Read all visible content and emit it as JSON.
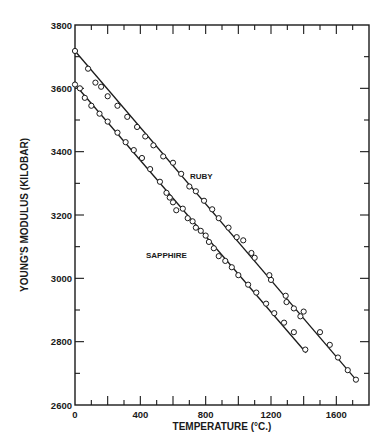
{
  "chart_data": {
    "type": "scatter",
    "title": "",
    "xlabel": "TEMPERATURE (°C.)",
    "ylabel": "YOUNG'S MODULUS (KILOBAR)",
    "xlim": [
      0,
      1800
    ],
    "ylim": [
      2600,
      3800
    ],
    "x_ticks": [
      0,
      400,
      800,
      1200,
      1600
    ],
    "x_tick_labels": [
      "0",
      "400",
      "800",
      "1200",
      "1600"
    ],
    "y_ticks": [
      2600,
      2800,
      3000,
      3200,
      3400,
      3600,
      3800
    ],
    "y_tick_labels": [
      "2600",
      "2800",
      "3000",
      "3200",
      "3400",
      "3600",
      "3800"
    ],
    "grid": false,
    "legend": "none (inline labels)",
    "annotations": [
      {
        "text": "RUBY",
        "x": 860,
        "y": 3290
      },
      {
        "text": "SAPPHIRE",
        "x": 560,
        "y": 3035
      }
    ],
    "series": [
      {
        "name": "RUBY",
        "marker": "open-circle",
        "fit_line": {
          "x0": 0,
          "y0": 3718,
          "x1": 1720,
          "y1": 2680
        },
        "points": [
          [
            0,
            3718
          ],
          [
            80,
            3662
          ],
          [
            125,
            3618
          ],
          [
            160,
            3605
          ],
          [
            200,
            3575
          ],
          [
            260,
            3545
          ],
          [
            320,
            3510
          ],
          [
            380,
            3478
          ],
          [
            430,
            3448
          ],
          [
            480,
            3420
          ],
          [
            540,
            3385
          ],
          [
            600,
            3365
          ],
          [
            650,
            3330
          ],
          [
            700,
            3290
          ],
          [
            740,
            3275
          ],
          [
            790,
            3245
          ],
          [
            840,
            3218
          ],
          [
            880,
            3190
          ],
          [
            940,
            3160
          ],
          [
            990,
            3130
          ],
          [
            1030,
            3120
          ],
          [
            1080,
            3080
          ],
          [
            1100,
            3065
          ],
          [
            1190,
            3010
          ],
          [
            1200,
            2995
          ],
          [
            1290,
            2945
          ],
          [
            1295,
            2925
          ],
          [
            1340,
            2905
          ],
          [
            1380,
            2880
          ],
          [
            1400,
            2895
          ],
          [
            1500,
            2830
          ],
          [
            1560,
            2790
          ],
          [
            1610,
            2750
          ],
          [
            1670,
            2710
          ],
          [
            1720,
            2680
          ]
        ]
      },
      {
        "name": "SAPPHIRE",
        "marker": "open-circle",
        "fit_line": {
          "x0": 0,
          "y0": 3612,
          "x1": 1415,
          "y1": 2765
        },
        "points": [
          [
            0,
            3612
          ],
          [
            30,
            3600
          ],
          [
            60,
            3570
          ],
          [
            100,
            3545
          ],
          [
            150,
            3520
          ],
          [
            200,
            3495
          ],
          [
            260,
            3460
          ],
          [
            310,
            3430
          ],
          [
            360,
            3405
          ],
          [
            410,
            3380
          ],
          [
            460,
            3345
          ],
          [
            520,
            3305
          ],
          [
            560,
            3270
          ],
          [
            580,
            3255
          ],
          [
            600,
            3240
          ],
          [
            620,
            3215
          ],
          [
            660,
            3220
          ],
          [
            690,
            3190
          ],
          [
            720,
            3180
          ],
          [
            740,
            3160
          ],
          [
            770,
            3150
          ],
          [
            800,
            3135
          ],
          [
            820,
            3115
          ],
          [
            850,
            3095
          ],
          [
            880,
            3070
          ],
          [
            920,
            3055
          ],
          [
            960,
            3035
          ],
          [
            1000,
            3010
          ],
          [
            1060,
            2980
          ],
          [
            1110,
            2955
          ],
          [
            1170,
            2920
          ],
          [
            1220,
            2890
          ],
          [
            1280,
            2860
          ],
          [
            1340,
            2830
          ],
          [
            1410,
            2775
          ]
        ]
      }
    ]
  }
}
